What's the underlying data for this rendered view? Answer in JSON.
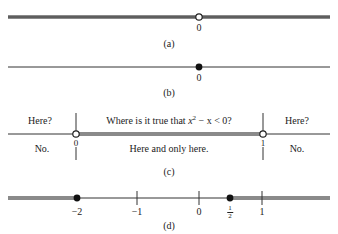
{
  "colors": {
    "line": "#333333",
    "shade": "#8a8a8a",
    "text": "#222222"
  },
  "panels": {
    "a": {
      "caption": "(a)",
      "point_label": "0",
      "point": {
        "value": 0,
        "type": "open"
      },
      "shaded": "entire line except 0"
    },
    "b": {
      "caption": "(b)",
      "point_label": "0",
      "point": {
        "value": 0,
        "type": "closed"
      },
      "shaded": "only the point 0"
    },
    "c": {
      "caption": "(c)",
      "question_prefix": "Where is it true that ",
      "question_var": "x",
      "question_exp": "2",
      "question_suffix": " − x < 0?",
      "left_question": "Here?",
      "right_question": "Here?",
      "left_answer": "No.",
      "right_answer": "No.",
      "middle_answer": "Here and only here.",
      "left_label": "0",
      "right_label": "1",
      "points": [
        {
          "value": 0,
          "type": "open"
        },
        {
          "value": 1,
          "type": "open"
        }
      ],
      "shaded": "(0, 1)"
    },
    "d": {
      "caption": "(d)",
      "tick_labels": [
        "−2",
        "−1",
        "0",
        "1"
      ],
      "half": {
        "num": "1",
        "den": "2"
      },
      "points": [
        {
          "value": -2,
          "type": "closed"
        },
        {
          "value": 0.5,
          "type": "closed"
        }
      ],
      "shaded": "(-∞, −2] ∪ [1/2, ∞)"
    }
  }
}
